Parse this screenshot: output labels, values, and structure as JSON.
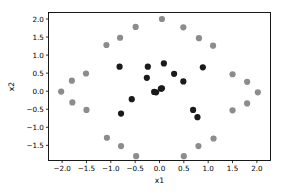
{
  "chart_data": {
    "type": "scatter",
    "title": "",
    "xlabel": "x1",
    "ylabel": "x2",
    "xlim": [
      -2.28,
      2.28
    ],
    "ylim": [
      -1.92,
      2.18
    ],
    "grid": false,
    "legend": "none",
    "xticks": [
      -2.0,
      -1.5,
      -1.0,
      -0.5,
      0.0,
      0.5,
      1.0,
      1.5,
      2.0
    ],
    "xticklabels": [
      "−2.0",
      "−1.5",
      "−1.0",
      "−0.5",
      "0.0",
      "0.5",
      "1.0",
      "1.5",
      "2.0"
    ],
    "yticks": [
      -1.5,
      -1.0,
      -0.5,
      0.0,
      0.5,
      1.0,
      1.5,
      2.0
    ],
    "yticklabels": [
      "−1.5",
      "−1.0",
      "−0.5",
      "0.0",
      "0.5",
      "1.0",
      "1.5",
      "2.0"
    ],
    "marker": "o",
    "marker_size": 3.1,
    "series": [
      {
        "name": "outer-ring",
        "color": "#8c8c8c",
        "points": [
          [
            -2.02,
            -0.01
          ],
          [
            -1.8,
            0.29
          ],
          [
            -1.79,
            -0.31
          ],
          [
            -1.51,
            0.49
          ],
          [
            -1.5,
            -0.52
          ],
          [
            -1.09,
            1.28
          ],
          [
            -1.08,
            -1.29
          ],
          [
            -0.81,
            1.48
          ],
          [
            -0.79,
            -1.52
          ],
          [
            -0.49,
            1.78
          ],
          [
            -0.48,
            -1.8
          ],
          [
            0.05,
            2.0
          ],
          [
            0.49,
            1.77
          ],
          [
            0.5,
            -1.8
          ],
          [
            0.81,
            1.47
          ],
          [
            0.8,
            -1.52
          ],
          [
            1.1,
            1.26
          ],
          [
            1.11,
            -1.31
          ],
          [
            1.5,
            0.47
          ],
          [
            1.5,
            -0.53
          ],
          [
            1.8,
            0.26
          ],
          [
            1.8,
            -0.34
          ],
          [
            2.02,
            -0.03
          ]
        ]
      },
      {
        "name": "inner-cluster",
        "color": "#1a1a1a",
        "points": [
          [
            -0.82,
            0.68
          ],
          [
            -0.79,
            -0.62
          ],
          [
            -0.57,
            -0.22
          ],
          [
            -0.26,
            0.37
          ],
          [
            -0.24,
            0.68
          ],
          [
            -0.11,
            -0.02
          ],
          [
            -0.07,
            -0.03
          ],
          [
            0.03,
            0.07
          ],
          [
            0.05,
            0.08
          ],
          [
            0.09,
            0.77
          ],
          [
            0.3,
            0.48
          ],
          [
            0.49,
            0.27
          ],
          [
            0.69,
            -0.52
          ],
          [
            0.78,
            -0.72
          ],
          [
            0.89,
            0.66
          ]
        ]
      }
    ]
  },
  "axes": {
    "x_label": "x1",
    "y_label": "x2"
  }
}
